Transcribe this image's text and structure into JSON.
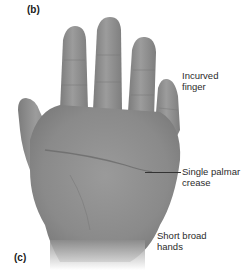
{
  "figure": {
    "panel_labels": {
      "top": "(b)",
      "bottom": "(c)"
    },
    "annotations": [
      {
        "line1": "Incurved",
        "line2": "finger"
      },
      {
        "line1": "Single palmar",
        "line2": "crease"
      },
      {
        "line1": "Short broad",
        "line2": "hands"
      }
    ],
    "colors": {
      "background": "#ffffff",
      "skin_gray": "#8e8e8e",
      "text": "#2b2b2b"
    }
  }
}
